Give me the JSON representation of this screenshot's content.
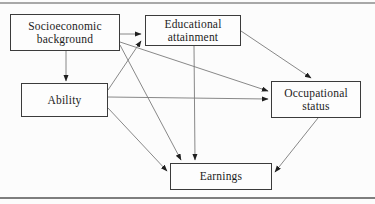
{
  "figure": {
    "type": "path-diagram"
  },
  "colors": {
    "background": "#fcfcfc",
    "box_border": "#3b3b3b",
    "edge": "#7a7a7a",
    "arrowhead": "#1f1f1f",
    "text": "#1c1c1c",
    "rule_top": "#a8a8a8",
    "rule_bottom": "#7e7e7e"
  },
  "diagram": {
    "nodes": [
      {
        "id": "socioeconomic-background",
        "label": "Socioeconomic background",
        "lines": [
          "Socioeconomic",
          "background"
        ]
      },
      {
        "id": "educational-attainment",
        "label": "Educational attainment",
        "lines": [
          "Educational",
          "attainment"
        ]
      },
      {
        "id": "ability",
        "label": "Ability",
        "lines": [
          "Ability"
        ]
      },
      {
        "id": "occupational-status",
        "label": "Occupational status",
        "lines": [
          "Occupational",
          "status"
        ]
      },
      {
        "id": "earnings",
        "label": "Earnings",
        "lines": [
          "Earnings"
        ]
      }
    ],
    "edges": [
      {
        "from": "socioeconomic-background",
        "to": "educational-attainment",
        "x1": 120,
        "y1": 34,
        "x2": 141,
        "y2": 34
      },
      {
        "from": "socioeconomic-background",
        "to": "ability",
        "x1": 66,
        "y1": 51,
        "x2": 66,
        "y2": 81
      },
      {
        "from": "socioeconomic-background",
        "to": "occupational-status",
        "x1": 120,
        "y1": 42,
        "x2": 268,
        "y2": 91
      },
      {
        "from": "socioeconomic-background",
        "to": "earnings",
        "x1": 120,
        "y1": 45,
        "x2": 181,
        "y2": 160
      },
      {
        "from": "ability",
        "to": "educational-attainment",
        "x1": 108,
        "y1": 90,
        "x2": 141,
        "y2": 41
      },
      {
        "from": "ability",
        "to": "occupational-status",
        "x1": 108,
        "y1": 97,
        "x2": 268,
        "y2": 99
      },
      {
        "from": "ability",
        "to": "earnings",
        "x1": 108,
        "y1": 108,
        "x2": 167,
        "y2": 171
      },
      {
        "from": "educational-attainment",
        "to": "occupational-status",
        "x1": 241,
        "y1": 31,
        "x2": 311,
        "y2": 78
      },
      {
        "from": "educational-attainment",
        "to": "earnings",
        "x1": 194,
        "y1": 46,
        "x2": 195,
        "y2": 160
      },
      {
        "from": "occupational-status",
        "to": "earnings",
        "x1": 318,
        "y1": 118,
        "x2": 275,
        "y2": 172
      }
    ]
  }
}
